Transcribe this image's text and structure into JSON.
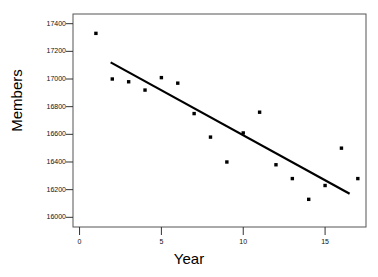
{
  "chart_data": {
    "type": "scatter",
    "title": "",
    "xlabel": "Year",
    "ylabel": "Members",
    "xlim": [
      -0.4,
      17.5
    ],
    "ylim": [
      15930,
      17470
    ],
    "xticks": [
      0,
      5,
      10,
      15
    ],
    "yticks": [
      16000,
      16200,
      16400,
      16600,
      16800,
      17000,
      17200,
      17400
    ],
    "xtick_labels": [
      "0",
      "5",
      "10",
      "15"
    ],
    "ytick_labels": [
      "16000",
      "16200",
      "16400",
      "16600",
      "16800",
      "17000",
      "17200",
      "17400"
    ],
    "grid": false,
    "legend": null,
    "frame": true,
    "marker": "square",
    "marker_color": "#000000",
    "x": [
      1,
      2,
      3,
      4,
      5,
      6,
      7,
      8,
      9,
      10,
      11,
      12,
      13,
      14,
      15,
      16,
      17
    ],
    "y": [
      17330,
      17000,
      16980,
      16920,
      17010,
      16970,
      16750,
      16580,
      16400,
      16610,
      16760,
      16380,
      16280,
      16130,
      16230,
      16500,
      16280
    ],
    "series": [
      {
        "name": "Members",
        "type": "scatter",
        "values": [
          17330,
          17000,
          16980,
          16920,
          17010,
          16970,
          16750,
          16580,
          16400,
          16610,
          16760,
          16380,
          16280,
          16130,
          16230,
          16500,
          16280
        ]
      },
      {
        "name": "fit-line",
        "type": "line",
        "color": "#000000",
        "x_endpoints": [
          1.9,
          16.5
        ],
        "y_endpoints": [
          17120,
          16170
        ]
      }
    ],
    "annotations": []
  },
  "axes": {
    "ylabel": "Members",
    "xlabel": "Year"
  }
}
